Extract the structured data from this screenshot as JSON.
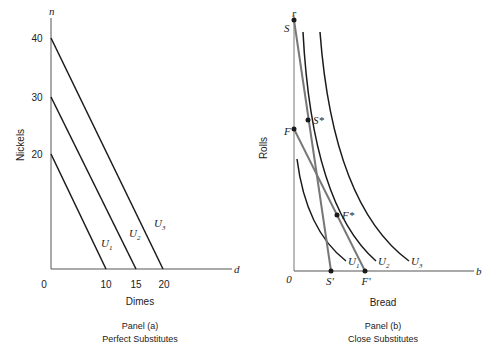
{
  "panel_a": {
    "y_axis_var": "n",
    "x_axis_var": "d",
    "y_axis_label": "Nickels",
    "x_axis_label": "Dimes",
    "origin": "0",
    "y_ticks": [
      "40",
      "30",
      "20"
    ],
    "x_ticks": [
      "10",
      "15",
      "20"
    ],
    "curves": [
      {
        "name": "U",
        "sub": "1"
      },
      {
        "name": "U",
        "sub": "2"
      },
      {
        "name": "U",
        "sub": "3"
      }
    ],
    "caption_line1": "Panel (a)",
    "caption_line2": "Perfect Substitutes"
  },
  "panel_b": {
    "y_axis_var": "r",
    "x_axis_var": "b",
    "y_axis_label": "Rolls",
    "x_axis_label": "Bread",
    "origin": "0",
    "points": {
      "S": "S",
      "F": "F",
      "S_star": "S*",
      "F_star": "F*",
      "S_prime": "S'",
      "F_prime": "F'"
    },
    "curves": [
      {
        "name": "U",
        "sub": "1"
      },
      {
        "name": "U",
        "sub": "2"
      },
      {
        "name": "U",
        "sub": "3"
      }
    ],
    "caption_line1": "Panel (b)",
    "caption_line2": "Close Substitutes"
  },
  "colors": {
    "line": "#1a1a1a",
    "budget_line": "#777777",
    "axis": "#555555"
  }
}
